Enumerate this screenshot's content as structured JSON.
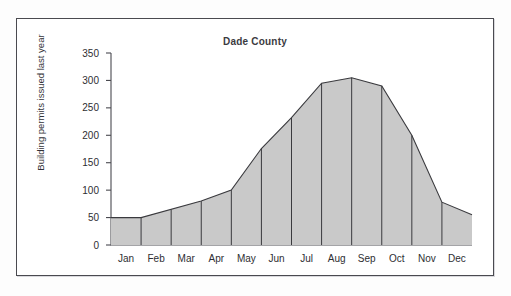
{
  "chart_data": {
    "type": "area",
    "title": "Dade County",
    "xlabel": "",
    "ylabel": "Building permits issued last year",
    "categories": [
      "Jan",
      "Feb",
      "Mar",
      "Apr",
      "May",
      "Jun",
      "Jul",
      "Aug",
      "Sep",
      "Oct",
      "Nov",
      "Dec"
    ],
    "values": [
      50,
      50,
      80,
      100,
      176,
      232,
      295,
      305,
      290,
      200,
      78,
      55
    ],
    "ylim": [
      0,
      350
    ],
    "ytick_labels": [
      "0",
      "50",
      "100",
      "150",
      "200",
      "250",
      "300",
      "350"
    ],
    "ytick_values": [
      0,
      50,
      100,
      150,
      200,
      250,
      300,
      350
    ],
    "grid": false,
    "legend": "none",
    "fill_color": "#c9c9c9",
    "line_color": "#3a3a3e",
    "axis_color": "#4a4a50",
    "background_color": "#ffffff",
    "frame_color": "#4a4a50"
  }
}
